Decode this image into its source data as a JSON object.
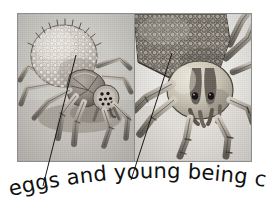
{
  "figure": {
    "kind": "two-panel-illustration",
    "caption": "eggs and young being carried",
    "palette": {
      "ink": "#111111",
      "frame_border": "#8d8d8d",
      "panel_left_bg": "#cfcdc8",
      "panel_right_bg": "#eceae6",
      "leader_line": "#1a1a1a",
      "body_mid": "#8f8a83",
      "body_dark": "#4a4640",
      "body_light": "#d8d4cd",
      "egg_light": "#e3e0d9",
      "egg_shadow": "#9a958d",
      "eye_dark": "#141414",
      "page_bg": "#ffffff"
    },
    "panels": [
      {
        "id": "panel-left",
        "name": "female-spider-with-egg-sac",
        "description": "Female spider seen from the front-left carrying a large round white egg sac on her abdomen",
        "features": [
          "egg-sac",
          "cephalothorax",
          "eye-cluster",
          "eight-legs",
          "pedipalps",
          "cast-shadow"
        ],
        "eye_count": 8
      },
      {
        "id": "panel-right",
        "name": "spider-close-up-with-spiderlings",
        "description": "Close-up of a spider's head and carapace with a dense mass of spiderlings riding on its back",
        "features": [
          "spiderling-mass",
          "carapace",
          "two-large-eyes",
          "chelicerae",
          "front-legs"
        ],
        "eye_count": 2
      }
    ],
    "leader_lines": [
      {
        "name": "leader-line-eggs",
        "from_label": "eggs",
        "points_to": "egg-sac on female spider in left panel",
        "x1": 43,
        "y1": 186,
        "x2": 76,
        "y2": 55
      },
      {
        "name": "leader-line-young",
        "from_label": "young",
        "points_to": "spiderling mass in right panel",
        "x1": 131,
        "y1": 180,
        "x2": 172,
        "y2": 53
      }
    ]
  }
}
